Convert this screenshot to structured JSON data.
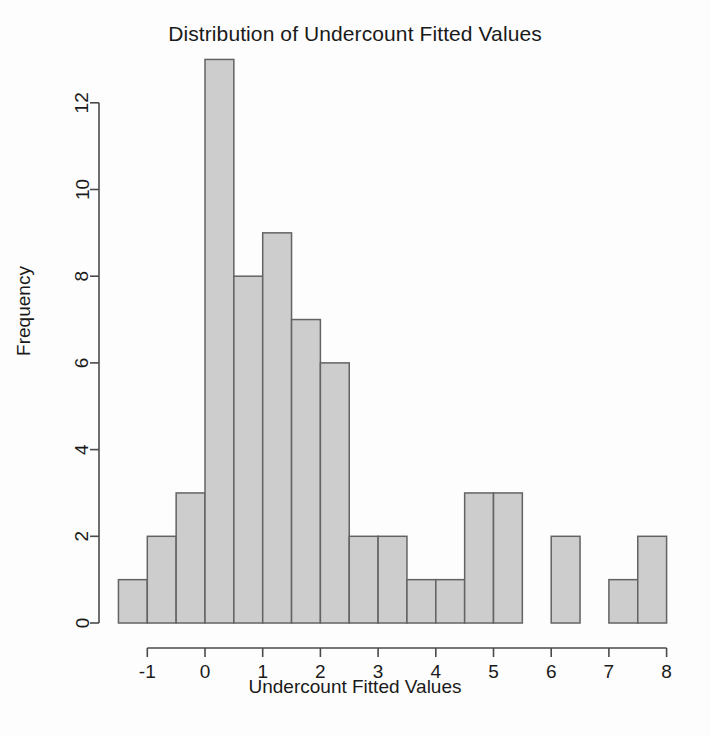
{
  "chart_data": {
    "type": "bar",
    "title": "Distribution of Undercount Fitted Values",
    "xlabel": "Undercount Fitted Values",
    "ylabel": "Frequency",
    "grid": false,
    "legend": null,
    "bin_width": 0.5,
    "bin_edges": [
      -1.5,
      -1.0,
      -0.5,
      0.0,
      0.5,
      1.0,
      1.5,
      2.0,
      2.5,
      3.0,
      3.5,
      4.0,
      4.5,
      5.0,
      5.5,
      6.0,
      6.5,
      7.0,
      7.5,
      8.0
    ],
    "categories": [
      "-1.5 to -1.0",
      "-1.0 to -0.5",
      "-0.5 to 0.0",
      "0.0 to 0.5",
      "0.5 to 1.0",
      "1.0 to 1.5",
      "1.5 to 2.0",
      "2.0 to 2.5",
      "2.5 to 3.0",
      "3.0 to 3.5",
      "3.5 to 4.0",
      "4.0 to 4.5",
      "4.5 to 5.0",
      "5.0 to 5.5",
      "5.5 to 6.0",
      "6.0 to 6.5",
      "6.5 to 7.0",
      "7.0 to 7.5",
      "7.5 to 8.0"
    ],
    "values": [
      1,
      2,
      3,
      13,
      8,
      9,
      7,
      6,
      2,
      2,
      1,
      1,
      3,
      3,
      0,
      2,
      0,
      1,
      2
    ],
    "xlim": [
      -1.5,
      8.0
    ],
    "ylim": [
      0,
      13
    ],
    "xticks": [
      -1,
      0,
      1,
      2,
      3,
      4,
      5,
      6,
      7,
      8
    ],
    "xtick_labels": [
      "-1",
      "0",
      "1",
      "2",
      "3",
      "4",
      "5",
      "6",
      "7",
      "8"
    ],
    "yticks": [
      0,
      2,
      4,
      6,
      8,
      10,
      12
    ],
    "ytick_labels": [
      "0",
      "2",
      "4",
      "6",
      "8",
      "10",
      "12"
    ],
    "bar_fill_color": "#cdcdcd",
    "bar_border_color": "#636363",
    "background_color": "#fdfdfd"
  }
}
